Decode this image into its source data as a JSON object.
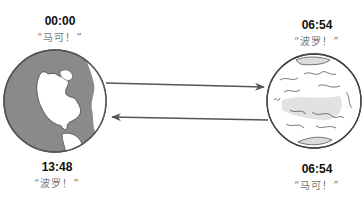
{
  "diagram": {
    "nodes": [
      {
        "id": "earth",
        "time": "00:00",
        "quote": "“马可！”"
      },
      {
        "id": "mars",
        "time": "06:54",
        "quote": "“波罗！”"
      }
    ],
    "bottom_labels": [
      {
        "id": "earth",
        "time": "13:48",
        "quote": "“波罗！”"
      },
      {
        "id": "mars",
        "time": "06:54",
        "quote": "“马可！”"
      }
    ],
    "arrows": [
      {
        "from": "earth",
        "to": "mars",
        "direction": "right"
      },
      {
        "from": "mars",
        "to": "earth",
        "direction": "left"
      }
    ],
    "colors": {
      "earth_land": "#8a8a8a",
      "earth_outline": "#555555",
      "mars_fill": "#e6e6e6",
      "mars_outline": "#444444",
      "arrow": "#555555",
      "quote_text": "#777777"
    }
  }
}
